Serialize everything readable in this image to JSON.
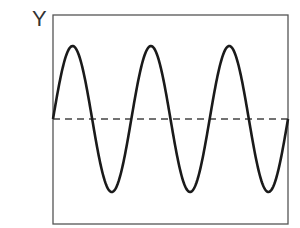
{
  "chart_data": {
    "type": "line",
    "title": "",
    "ylabel": "Y",
    "xlabel": "",
    "series": [
      {
        "name": "sine wave",
        "function": "sin",
        "cycles": 3,
        "amplitude": 1,
        "start_phase": 0
      }
    ],
    "baseline": {
      "y": 0,
      "style": "dashed"
    },
    "ylim": [
      -1.2,
      1.2
    ],
    "grid": false
  },
  "labels": {
    "y_axis": "Y"
  }
}
